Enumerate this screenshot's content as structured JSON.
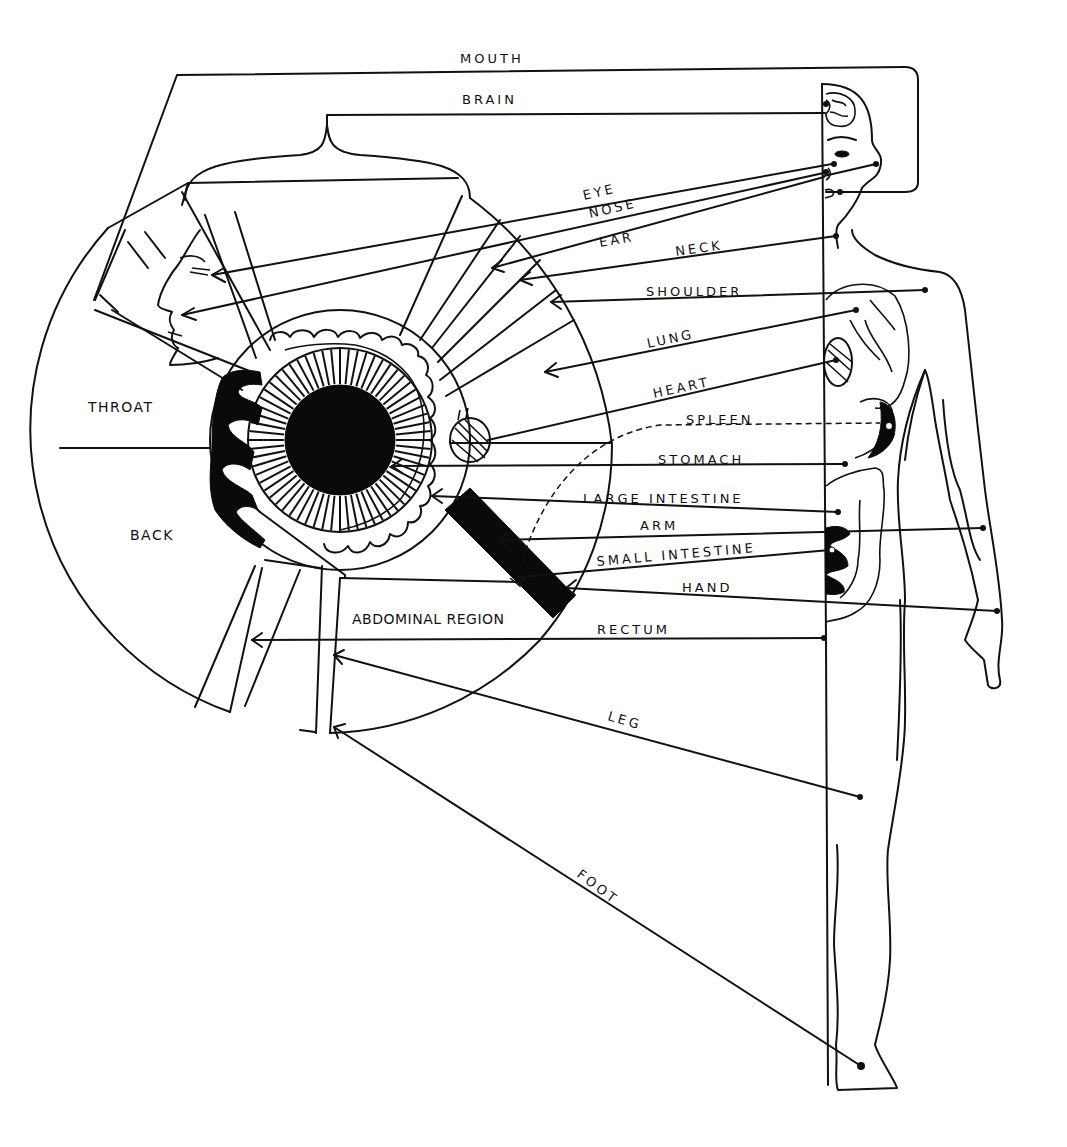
{
  "diagram": {
    "type": "iridology-chart",
    "labels": {
      "mouth": "MOUTH",
      "brain": "BRAIN",
      "eye": "EYE",
      "nose": "NOSE",
      "ear": "EAR",
      "neck": "NECK",
      "shoulder": "SHOULDER",
      "lung": "LUNG",
      "heart": "HEART",
      "spleen": "SPLEEN",
      "stomach": "STOMACH",
      "large_intestine": "LARGE  INTESTINE",
      "arm": "ARM",
      "small_intestine": "SMALL  INTESTINE",
      "hand": "HAND",
      "rectum": "RECTUM",
      "leg": "LEG",
      "foot": "FOOT",
      "throat": "THROAT",
      "back": "BACK",
      "abdominal_region": "ABDOMINAL REGION"
    },
    "figures": {
      "iris": "iris-segment-map",
      "body": "human-body-outline"
    },
    "colors": {
      "ink": "#111111",
      "background": "#ffffff"
    }
  }
}
